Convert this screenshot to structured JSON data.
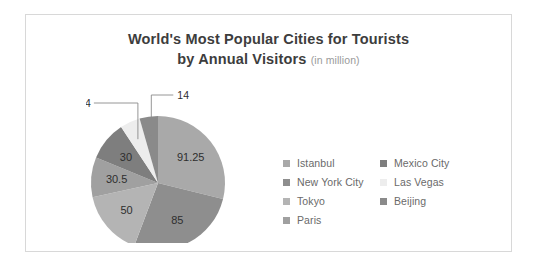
{
  "card": {
    "border_color": "#d8d8d8",
    "background": "#ffffff"
  },
  "title": {
    "line1": "World's Most Popular Cities for Tourists",
    "line2": "by Annual Visitors",
    "unit_note": "(in million)",
    "color": "#3d3d3d",
    "note_color": "#9a9a9a"
  },
  "legend": {
    "position": "right",
    "text_color": "#6a6a6a",
    "columns": [
      {
        "items": [
          0,
          1,
          2,
          3
        ]
      },
      {
        "items": [
          4,
          5,
          6
        ]
      }
    ]
  },
  "chart_data": {
    "type": "pie",
    "title": "World's Most Popular Cities for Tourists by Annual Visitors (in million)",
    "unit": "million visitors",
    "categories": [
      "Istanbul",
      "New York City",
      "Tokyo",
      "Paris",
      "Mexico City",
      "Las Vegas",
      "Beijing"
    ],
    "values": [
      91.25,
      85,
      50,
      30.5,
      30,
      15.34,
      14
    ],
    "labels": [
      "91.25",
      "85",
      "50",
      "30.5",
      "30",
      "15.34",
      "14"
    ],
    "colors": [
      "#a9a9a9",
      "#8e8e8e",
      "#b4b4b4",
      "#a0a0a0",
      "#7e7e7e",
      "#ededed",
      "#8a8a8a"
    ],
    "label_placement": [
      "inside",
      "inside",
      "inside",
      "inside",
      "inside",
      "outside",
      "outside"
    ],
    "total": 316.09,
    "start_angle_deg": 0,
    "direction": "clockwise",
    "legend_position": "right",
    "grid": false
  }
}
